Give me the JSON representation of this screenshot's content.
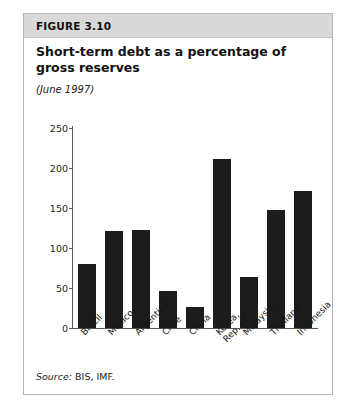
{
  "figure": {
    "number": "FIGURE 3.10",
    "title": "Short-term debt as a percentage of gross reserves",
    "subtitle": "(June 1997)",
    "source_label": "Source:",
    "source_value": " BIS, IMF."
  },
  "colors": {
    "header_band": "#d9d9d9",
    "bar_fill": "#1c1c1c",
    "axis": "#555555",
    "panel_border": "#b4b4b4"
  },
  "chart_data": {
    "type": "bar",
    "title": "Short-term debt as a percentage of gross reserves",
    "subtitle": "(June 1997)",
    "xlabel": "",
    "ylabel": "",
    "ylim": [
      0,
      250
    ],
    "yticks": [
      0,
      50,
      100,
      150,
      200,
      250
    ],
    "ytick_labels": [
      "0",
      "50",
      "100",
      "150",
      "200",
      "250"
    ],
    "grid": false,
    "legend": null,
    "categories": [
      "Brazil",
      "Mexico",
      "Argentina",
      "Chile",
      "China",
      "Korea,\nRep. of",
      "Malaysia",
      "Thailand",
      "Indonesia"
    ],
    "values": [
      80,
      121,
      123,
      46,
      26,
      211,
      64,
      148,
      171
    ],
    "source": "Source: BIS, IMF."
  }
}
